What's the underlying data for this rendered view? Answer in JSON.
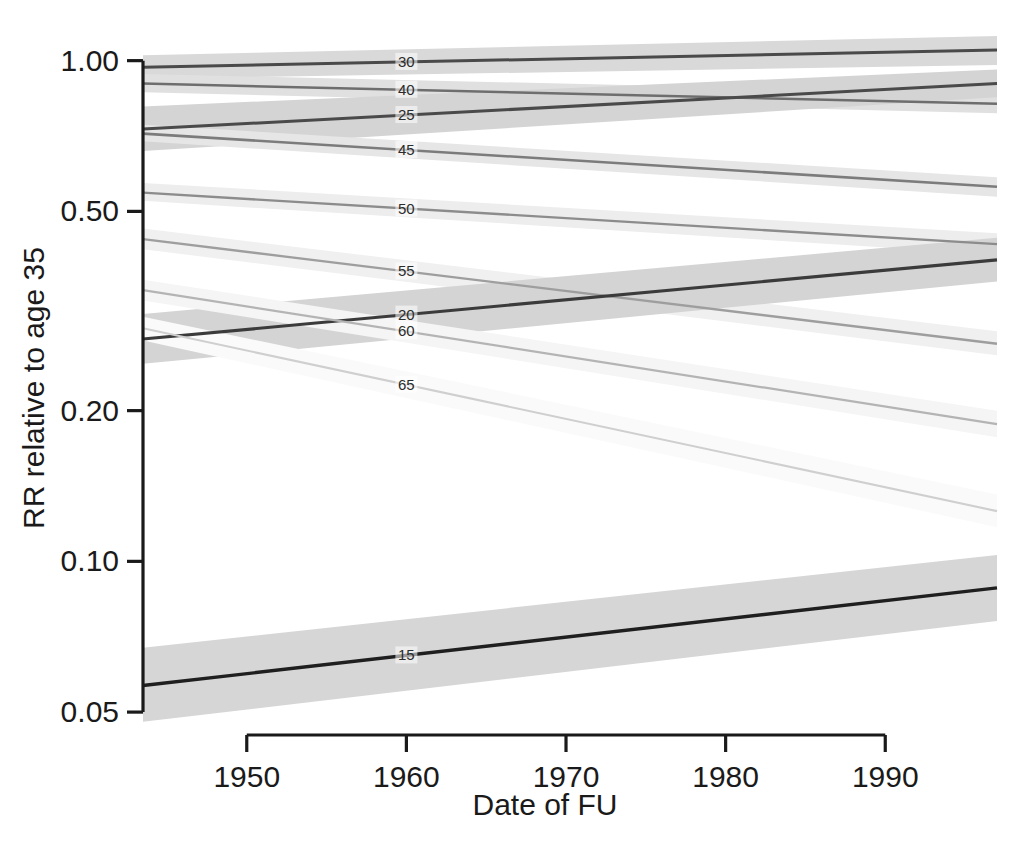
{
  "chart_data": {
    "type": "line",
    "title": "",
    "subtitle": "",
    "xlabel": "Date of FU",
    "ylabel": "RR relative to age 35",
    "yscale": "log",
    "xlim": [
      1943.5,
      1997.0
    ],
    "ylim": [
      0.045,
      1.12
    ],
    "grid": false,
    "legend": "inline-labels",
    "xticks": [
      1950,
      1960,
      1970,
      1980,
      1990
    ],
    "xtick_labels": [
      "1950",
      "1960",
      "1970",
      "1980",
      "1990"
    ],
    "yticks": [
      1.0,
      0.5,
      0.2,
      0.1,
      0.05
    ],
    "ytick_labels": [
      "1.00",
      "0.50",
      "0.20",
      "0.10",
      "0.05"
    ],
    "annotation_note": "Each line is labelled inline near x=1960 with its age group",
    "series": [
      {
        "name": "30",
        "label": "30",
        "label_x": 1960,
        "color": "#4a4a4a",
        "band_color": "#d9d9d9",
        "line_width": 3.0,
        "x": [
          1943.5,
          1997.0
        ],
        "y": [
          0.97,
          1.05
        ],
        "y_lower": [
          0.92,
          0.98
        ],
        "y_upper": [
          1.025,
          1.12
        ]
      },
      {
        "name": "40",
        "label": "40",
        "label_x": 1960,
        "color": "#6e6e6e",
        "band_color": "#e0e0e0",
        "line_width": 2.6,
        "x": [
          1943.5,
          1997.0
        ],
        "y": [
          0.9,
          0.82
        ],
        "y_lower": [
          0.865,
          0.785
        ],
        "y_upper": [
          0.94,
          0.86
        ]
      },
      {
        "name": "25",
        "label": "25",
        "label_x": 1960,
        "color": "#4a4a4a",
        "band_color": "#d4d4d4",
        "line_width": 3.0,
        "x": [
          1943.5,
          1997.0
        ],
        "y": [
          0.73,
          0.9
        ],
        "y_lower": [
          0.66,
          0.845
        ],
        "y_upper": [
          0.81,
          0.96
        ]
      },
      {
        "name": "45",
        "label": "45",
        "label_x": 1960,
        "color": "#7c7c7c",
        "band_color": "#e6e6e6",
        "line_width": 2.6,
        "x": [
          1943.5,
          1997.0
        ],
        "y": [
          0.715,
          0.56
        ],
        "y_lower": [
          0.69,
          0.535
        ],
        "y_upper": [
          0.745,
          0.585
        ]
      },
      {
        "name": "50",
        "label": "50",
        "label_x": 1960,
        "color": "#8c8c8c",
        "band_color": "#ededed",
        "line_width": 2.4,
        "x": [
          1943.5,
          1997.0
        ],
        "y": [
          0.545,
          0.43
        ],
        "y_lower": [
          0.525,
          0.41
        ],
        "y_upper": [
          0.57,
          0.452
        ]
      },
      {
        "name": "55",
        "label": "55",
        "label_x": 1960,
        "color": "#9e9e9e",
        "band_color": "#f0f0f0",
        "line_width": 2.3,
        "x": [
          1943.5,
          1997.0
        ],
        "y": [
          0.44,
          0.272
        ],
        "y_lower": [
          0.42,
          0.258
        ],
        "y_upper": [
          0.462,
          0.288
        ]
      },
      {
        "name": "20",
        "label": "20",
        "label_x": 1960,
        "color": "#3b3b3b",
        "band_color": "#d4d4d4",
        "line_width": 3.2,
        "x": [
          1943.5,
          1997.0
        ],
        "y": [
          0.278,
          0.4
        ],
        "y_lower": [
          0.248,
          0.362
        ],
        "y_upper": [
          0.312,
          0.443
        ]
      },
      {
        "name": "60",
        "label": "60",
        "label_x": 1960,
        "color": "#b4b4b4",
        "band_color": "#f5f5f5",
        "line_width": 2.2,
        "x": [
          1943.5,
          1997.0
        ],
        "y": [
          0.348,
          0.188
        ],
        "y_lower": [
          0.332,
          0.177
        ],
        "y_upper": [
          0.365,
          0.2
        ]
      },
      {
        "name": "65",
        "label": "65",
        "label_x": 1960,
        "color": "#cfcfcf",
        "band_color": "#fafafa",
        "line_width": 2.1,
        "x": [
          1943.5,
          1997.0
        ],
        "y": [
          0.292,
          0.126
        ],
        "y_lower": [
          0.276,
          0.117
        ],
        "y_upper": [
          0.308,
          0.136
        ]
      },
      {
        "name": "15",
        "label": "15",
        "label_x": 1960,
        "color": "#1f1f1f",
        "band_color": "#d6d6d6",
        "line_width": 3.4,
        "x": [
          1943.5,
          1997.0
        ],
        "y": [
          0.0565,
          0.0885
        ],
        "y_lower": [
          0.0478,
          0.076
        ],
        "y_upper": [
          0.0672,
          0.103
        ]
      }
    ]
  },
  "geometry": {
    "plot_left": 143,
    "plot_right": 997,
    "plot_top": 36,
    "plot_bottom": 735,
    "x_axis_start": 206,
    "x_axis_end": 883
  }
}
